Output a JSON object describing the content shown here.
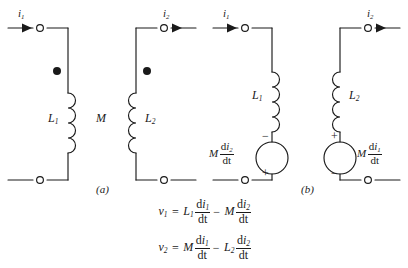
{
  "figure": {
    "stroke_color": "#1a1a1a",
    "text_color": "#1a1a1a",
    "background": "#ffffff"
  },
  "part_a": {
    "caption": "(a)",
    "current_left": {
      "symbol": "i",
      "sub": "1"
    },
    "current_right": {
      "symbol": "i",
      "sub": "2"
    },
    "inductor_left": {
      "symbol": "L",
      "sub": "1"
    },
    "inductor_right": {
      "symbol": "L",
      "sub": "2"
    },
    "mutual": "M",
    "dot_left": "polarity-dot",
    "dot_right": "polarity-dot"
  },
  "part_b": {
    "caption": "(b)",
    "current_left": {
      "symbol": "i",
      "sub": "1"
    },
    "current_right": {
      "symbol": "i",
      "sub": "2"
    },
    "inductor_left": {
      "symbol": "L",
      "sub": "1"
    },
    "inductor_right": {
      "symbol": "L",
      "sub": "2"
    },
    "source_left": {
      "coefficient": "M",
      "numerator_d": "d",
      "numerator_var": "i",
      "numerator_sub": "2",
      "denominator": "dt",
      "sign_top": "−",
      "sign_bottom": "+"
    },
    "source_right": {
      "coefficient": "M",
      "numerator_d": "d",
      "numerator_var": "i",
      "numerator_sub": "1",
      "denominator": "dt",
      "sign_top": "+",
      "sign_bottom": "−"
    }
  },
  "equations": [
    {
      "lhs": {
        "symbol": "v",
        "sub": "1"
      },
      "equals": "=",
      "terms": [
        {
          "op": "",
          "coef": "L",
          "coef_sub": "1",
          "num_d": "d",
          "num_var": "i",
          "num_sub": "1",
          "den": "dt"
        },
        {
          "op": "−",
          "coef": "M",
          "coef_sub": "",
          "num_d": "d",
          "num_var": "i",
          "num_sub": "2",
          "den": "dt"
        }
      ]
    },
    {
      "lhs": {
        "symbol": "v",
        "sub": "2"
      },
      "equals": "=",
      "terms": [
        {
          "op": "",
          "coef": "M",
          "coef_sub": "",
          "num_d": "d",
          "num_var": "i",
          "num_sub": "1",
          "den": "dt"
        },
        {
          "op": "−",
          "coef": "L",
          "coef_sub": "2",
          "num_d": "d",
          "num_var": "i",
          "num_sub": "2",
          "den": "dt"
        }
      ]
    }
  ]
}
